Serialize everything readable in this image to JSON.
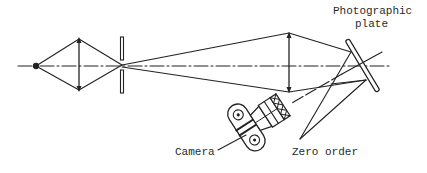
{
  "diagram": {
    "labels": {
      "plate_line1": "Photographic",
      "plate_line2": "plate",
      "camera": "Camera",
      "zero_order": "Zero order"
    },
    "elements": [
      {
        "id": "point-source",
        "type": "point"
      },
      {
        "id": "condenser-lens",
        "type": "lens"
      },
      {
        "id": "slit",
        "type": "aperture"
      },
      {
        "id": "collimating-lens",
        "type": "lens"
      },
      {
        "id": "photographic-plate",
        "type": "plate"
      },
      {
        "id": "camera",
        "type": "camera"
      }
    ],
    "colors": {
      "ink": "#222222",
      "background": "#ffffff"
    }
  }
}
